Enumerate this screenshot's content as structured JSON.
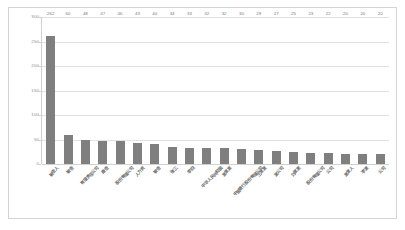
{
  "chart_data": {
    "type": "bar",
    "title": "",
    "xlabel": "",
    "ylabel": "",
    "ylim": [
      0,
      300
    ],
    "yticks": [
      "0",
      "50",
      "100",
      "150",
      "200",
      "250",
      "300"
    ],
    "grid": true,
    "legend": "none",
    "bar_color": "#7f7f7f",
    "categories": [
      "被告人",
      "被告",
      "有限责任公司",
      "原告",
      "股份有限公司",
      "人力资",
      "被告",
      "张三",
      "李四",
      "中华人民共和国",
      "某某某",
      "中国银行股份有限公司",
      "王某某",
      "某公司",
      "刘某某",
      "股份有限公司",
      "公司",
      "某某人",
      "李某",
      "公司"
    ],
    "values": [
      262,
      60,
      48,
      47,
      46,
      43,
      40,
      34,
      33,
      32,
      32,
      30,
      29,
      27,
      25,
      23,
      22,
      20,
      20,
      20
    ]
  }
}
